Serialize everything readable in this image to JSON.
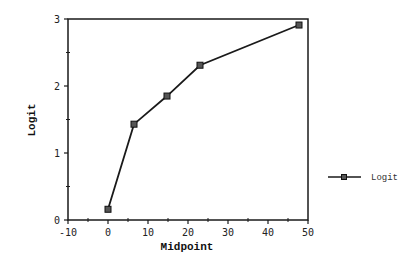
{
  "chart_data": {
    "type": "line",
    "title": "",
    "xlabel": "Midpoint",
    "ylabel": "Logit",
    "xlim": [
      -10,
      50
    ],
    "ylim": [
      0,
      3
    ],
    "x_ticks": [
      -10,
      0,
      10,
      20,
      30,
      40,
      50
    ],
    "x_tick_labels": [
      "-10",
      "0",
      "10",
      "20",
      "30",
      "40",
      "50"
    ],
    "y_ticks": [
      0,
      1,
      2,
      3
    ],
    "y_tick_labels": [
      "0",
      "1",
      "2",
      "3"
    ],
    "grid": false,
    "legend_position": "right",
    "series": [
      {
        "name": "Logit",
        "marker": "square",
        "color": "#1a1a1a",
        "x": [
          0,
          6.5,
          14.75,
          23,
          47.75
        ],
        "values": [
          0.16,
          1.43,
          1.85,
          2.31,
          2.91
        ]
      }
    ]
  },
  "legend": {
    "items": [
      {
        "label": "Logit"
      }
    ]
  }
}
